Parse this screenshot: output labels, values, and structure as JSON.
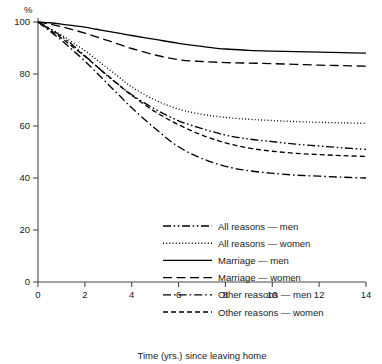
{
  "chart_data": {
    "type": "line",
    "title": "",
    "subtitle": "",
    "xlabel": "Time (yrs.) since leaving home",
    "ylabel": "%",
    "xlim": [
      0,
      14
    ],
    "ylim": [
      0,
      100
    ],
    "xticks": [
      "0",
      "2",
      "4",
      "6",
      "8",
      "10",
      "12",
      "14"
    ],
    "xtick_values": [
      0,
      2,
      4,
      6,
      8,
      10,
      12,
      14
    ],
    "yticks": [
      "0",
      "20",
      "40",
      "60",
      "80",
      "100"
    ],
    "ytick_values": [
      0,
      20,
      40,
      60,
      80,
      100
    ],
    "grid": false,
    "legend_position": "lower-center",
    "x": [
      0,
      0.5,
      1,
      1.5,
      2,
      2.5,
      3,
      3.5,
      4,
      5,
      6,
      7,
      8,
      9,
      10,
      11,
      12,
      13,
      14
    ],
    "series": [
      {
        "name": "All reasons — men",
        "style": "dash-dot-dot",
        "values": [
          100,
          97.5,
          94.5,
          91,
          87,
          83,
          79,
          75.5,
          72,
          66.5,
          62,
          59,
          56.5,
          55,
          54,
          53,
          52.3,
          51.6,
          51
        ]
      },
      {
        "name": "All reasons — women",
        "style": "dotted",
        "values": [
          100,
          97.5,
          95,
          92,
          89,
          85.5,
          82,
          78.5,
          75,
          70,
          66.5,
          64.5,
          63.3,
          62.6,
          62.1,
          61.7,
          61.4,
          61.2,
          61
        ]
      },
      {
        "name": "Marriage — men",
        "style": "solid",
        "values": [
          100,
          99.7,
          99.2,
          98.6,
          98,
          97.2,
          96.4,
          95.6,
          94.8,
          93.3,
          91.8,
          90.6,
          89.6,
          89.1,
          88.8,
          88.6,
          88.4,
          88.2,
          88
        ]
      },
      {
        "name": "Marriage — women",
        "style": "dashed-long",
        "values": [
          100,
          99.2,
          98.2,
          97,
          95.7,
          94.3,
          92.8,
          91.3,
          89.8,
          87.3,
          85.5,
          84.8,
          84.4,
          84.2,
          84,
          83.7,
          83.4,
          83.2,
          83
        ]
      },
      {
        "name": "Other reasons — men",
        "style": "dash-dot",
        "values": [
          100,
          96.5,
          93,
          89,
          85,
          80.5,
          76,
          71.5,
          67,
          59,
          52,
          47.5,
          44.5,
          42.8,
          41.8,
          41.1,
          40.7,
          40.3,
          40
        ]
      },
      {
        "name": "Other reasons — women",
        "style": "dashed-short",
        "values": [
          100,
          97,
          93.8,
          90.3,
          86.8,
          83,
          79.2,
          75.4,
          71.8,
          65.5,
          60.5,
          56.5,
          53.5,
          51.5,
          50.3,
          49.5,
          49,
          48.6,
          48.3
        ]
      }
    ]
  },
  "legend": {
    "items": [
      {
        "label": "All reasons — men"
      },
      {
        "label": "All reasons — women"
      },
      {
        "label": "Marriage — men"
      },
      {
        "label": "Marriage — women"
      },
      {
        "label": "Other reasons — men"
      },
      {
        "label": "Other reasons — women"
      }
    ]
  },
  "axes": {
    "y_unit_label": "%",
    "x_axis_title": "Time (yrs.) since leaving home"
  },
  "colors": {
    "ink": "#000000",
    "axis": "#4a4a4a",
    "background": "#ffffff"
  }
}
